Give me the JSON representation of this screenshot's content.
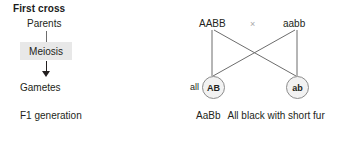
{
  "diagram": {
    "title": "First cross",
    "background_color": "#ffffff",
    "text_color": "#231f20",
    "line_color": "#6d6d6d",
    "meiosis_box_color": "#e8e8e8",
    "circle_fill_color": "#f2f2f2",
    "circle_border_color": "#8c8c8c",
    "cross_symbol_color": "#a7a7a7"
  },
  "stages": {
    "parents_label": "Parents",
    "meiosis_label": "Meiosis",
    "gametes_label": "Gametes",
    "f1_label": "F1 generation"
  },
  "cross": {
    "parent_left_genotype": "AABB",
    "cross_symbol": "×",
    "parent_right_genotype": "aabb",
    "gamete_left": "AB",
    "gamete_right": "ab",
    "gamete_quantifier": "all",
    "f1_genotype": "AaBb",
    "f1_phenotype": "All black with short fur"
  }
}
